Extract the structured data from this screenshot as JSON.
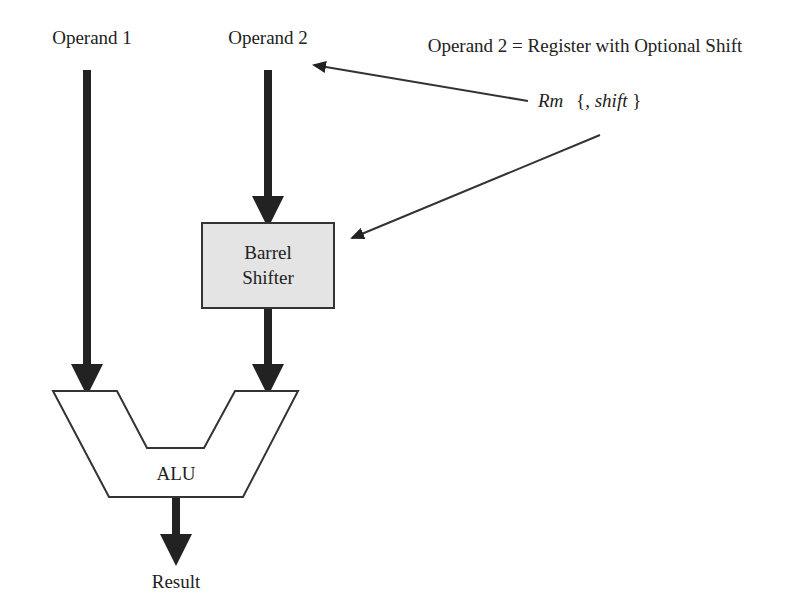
{
  "diagram": {
    "operand1_label": "Operand 1",
    "operand2_label": "Operand 2",
    "annotation_title": "Operand 2 = Register with Optional Shift",
    "register_label": "Rm",
    "shift_open": "{, ",
    "shift_label": "shift",
    "shift_close": "}",
    "barrel_shifter_line1": "Barrel",
    "barrel_shifter_line2": "Shifter",
    "alu_label": "ALU",
    "result_label": "Result",
    "colors": {
      "stroke": "#222222",
      "shifter_fill": "#e4e4e4",
      "alu_fill": "#ffffff"
    }
  }
}
